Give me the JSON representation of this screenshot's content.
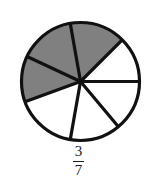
{
  "figure": {
    "background_color": "#ffffff"
  },
  "label": {
    "numerator": "3",
    "denominator": "7",
    "text": "3/7",
    "color": "#1b1b1b"
  },
  "chart_data": {
    "type": "pie",
    "title": "",
    "subtitle": "",
    "xlabel": "",
    "ylabel": "",
    "legend_position": "none",
    "grid": false,
    "total_slices": 7,
    "shaded_slices": 3,
    "fraction": "3/7",
    "fraction_value": 0.4286,
    "center_x": 80.5,
    "center_y": 81.5,
    "radius": 59,
    "stroke_color": "#111111",
    "stroke_width": 3.2,
    "shaded_color": "#808080",
    "unshaded_color": "#ffffff",
    "categories": [
      "slice-1",
      "slice-2",
      "slice-3",
      "slice-4",
      "slice-5",
      "slice-6",
      "slice-7"
    ],
    "values": [
      1,
      1,
      1,
      1,
      1,
      1,
      1
    ],
    "slices": [
      {
        "name": "slice-1",
        "start_angle": 45,
        "end_angle": 100,
        "shaded": true,
        "fill": "#808080"
      },
      {
        "name": "slice-2",
        "start_angle": 100,
        "end_angle": 155,
        "shaded": true,
        "fill": "#808080"
      },
      {
        "name": "slice-3",
        "start_angle": 155,
        "end_angle": 200,
        "shaded": true,
        "fill": "#808080"
      },
      {
        "name": "slice-4",
        "start_angle": 200,
        "end_angle": 260,
        "shaded": false,
        "fill": "#ffffff"
      },
      {
        "name": "slice-5",
        "start_angle": 260,
        "end_angle": 310,
        "shaded": false,
        "fill": "#ffffff"
      },
      {
        "name": "slice-6",
        "start_angle": 310,
        "end_angle": 360,
        "shaded": false,
        "fill": "#ffffff"
      },
      {
        "name": "slice-7",
        "start_angle": 0,
        "end_angle": 45,
        "shaded": false,
        "fill": "#ffffff"
      }
    ],
    "spoke_angles": [
      0,
      45,
      100,
      155,
      200,
      260,
      310
    ]
  }
}
